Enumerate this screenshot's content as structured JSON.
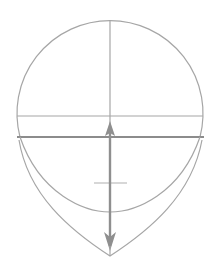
{
  "diagram": {
    "colors": {
      "background": "#ffffff",
      "thin_line": "#a6a6a6",
      "thick_line": "#8c8c8c",
      "arrow": "#8f8f8f"
    },
    "cranium_circle": {
      "cx": 110,
      "cy": 113,
      "r": 93
    },
    "brow_line": {
      "y": 116,
      "x1": 17,
      "x2": 203
    },
    "nose_line": {
      "y": 137,
      "x1": 17,
      "x2": 204
    },
    "center_line": {
      "x": 110,
      "y_top": 20,
      "y_bottom": 256
    },
    "measure_arrow": {
      "x": 110,
      "y_top": 122,
      "y_bottom": 251,
      "direction": "both"
    },
    "mid_tick": {
      "y": 183,
      "x1": 94,
      "x2": 127
    },
    "lower_arc": {
      "x1": 20,
      "y1": 137,
      "bottom_y": 212,
      "x2": 201
    },
    "jaw": {
      "x1": 18,
      "y1": 140,
      "chin_x": 110,
      "chin_y": 256,
      "x2": 202
    }
  }
}
